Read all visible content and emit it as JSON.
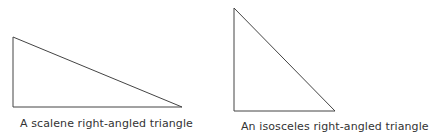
{
  "figures": [
    {
      "name": "scalene-right-triangle",
      "caption": "A scalene right-angled triangle",
      "points": "13,37 13,107 182,107"
    },
    {
      "name": "isosceles-right-triangle",
      "caption": "An isosceles right-angled triangle",
      "points": "234,8 234,111 335,111"
    }
  ],
  "colors": {
    "stroke": "#444444",
    "text": "#333333"
  }
}
